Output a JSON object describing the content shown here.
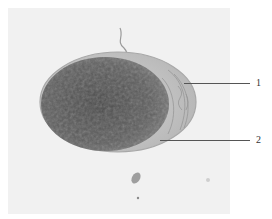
{
  "figure": {
    "labels": [
      {
        "id": "1",
        "text": "1"
      },
      {
        "id": "2",
        "text": "2"
      }
    ],
    "colors": {
      "background": "#f1f1f1",
      "egg_core": "#5c5c5c",
      "egg_shell": "#bdbdbd",
      "leader_line": "#555555"
    }
  }
}
